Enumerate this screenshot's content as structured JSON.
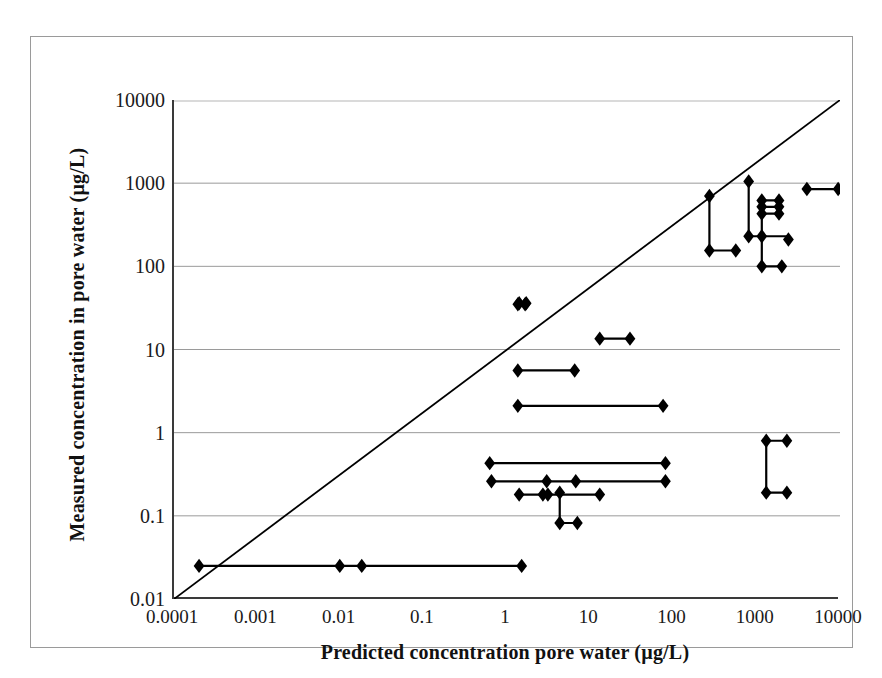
{
  "chart_data": {
    "type": "scatter",
    "title": "",
    "xlabel": "Predicted concentration pore water (µg/L)",
    "ylabel": "Measured concentration in  pore water (µg/L)",
    "xscale": "log",
    "yscale": "log",
    "xlim": [
      0.0001,
      10000
    ],
    "ylim": [
      0.01,
      10000
    ],
    "xticks": [
      "0.0001",
      "0.001",
      "0.01",
      "0.1",
      "1",
      "10",
      "100",
      "1000",
      "10000"
    ],
    "xtick_values": [
      0.0001,
      0.001,
      0.01,
      0.1,
      1,
      10,
      100,
      1000,
      10000
    ],
    "yticks": [
      "10000",
      "1000",
      "100",
      "10",
      "1",
      "0.1",
      "0.01"
    ],
    "ytick_values": [
      10000,
      1000,
      100,
      10,
      1,
      0.1,
      0.01
    ],
    "grid": "horizontal-major-only",
    "legend": "none",
    "marker": "filled-diamond",
    "marker_color": "#000000",
    "line_color": "#000000",
    "reference_line": {
      "name": "1:1 line",
      "from": [
        0.0001,
        0.01
      ],
      "to": [
        10000,
        10000
      ],
      "style": "solid",
      "color": "#000000"
    },
    "points": [
      {
        "x": 0.0002,
        "y": 0.025
      },
      {
        "x": 0.0098,
        "y": 0.025
      },
      {
        "x": 0.018,
        "y": 0.025
      },
      {
        "x": 1.5,
        "y": 0.025
      },
      {
        "x": 1.35,
        "y": 35
      },
      {
        "x": 1.65,
        "y": 35
      },
      {
        "x": 1.4,
        "y": 36
      },
      {
        "x": 1.7,
        "y": 36
      },
      {
        "x": 13,
        "y": 13.5
      },
      {
        "x": 30,
        "y": 13.5
      },
      {
        "x": 1.35,
        "y": 5.6
      },
      {
        "x": 6.5,
        "y": 5.6
      },
      {
        "x": 1.35,
        "y": 2.1
      },
      {
        "x": 75,
        "y": 2.1
      },
      {
        "x": 0.62,
        "y": 0.43
      },
      {
        "x": 80,
        "y": 0.43
      },
      {
        "x": 0.65,
        "y": 0.26
      },
      {
        "x": 3.0,
        "y": 0.26
      },
      {
        "x": 6.7,
        "y": 0.26
      },
      {
        "x": 80,
        "y": 0.26
      },
      {
        "x": 1.4,
        "y": 0.18
      },
      {
        "x": 2.7,
        "y": 0.18
      },
      {
        "x": 3.1,
        "y": 0.18
      },
      {
        "x": 13,
        "y": 0.18
      },
      {
        "x": 4.3,
        "y": 0.082
      },
      {
        "x": 7.0,
        "y": 0.082
      },
      {
        "x": 4.3,
        "y": 0.19
      },
      {
        "x": 270,
        "y": 700
      },
      {
        "x": 270,
        "y": 155
      },
      {
        "x": 560,
        "y": 155
      },
      {
        "x": 800,
        "y": 1050
      },
      {
        "x": 800,
        "y": 230
      },
      {
        "x": 1150,
        "y": 230
      },
      {
        "x": 1150,
        "y": 520
      },
      {
        "x": 1850,
        "y": 520
      },
      {
        "x": 1150,
        "y": 430
      },
      {
        "x": 1850,
        "y": 430
      },
      {
        "x": 1150,
        "y": 620
      },
      {
        "x": 1850,
        "y": 620
      },
      {
        "x": 2400,
        "y": 210
      },
      {
        "x": 1150,
        "y": 100
      },
      {
        "x": 2000,
        "y": 100
      },
      {
        "x": 4000,
        "y": 850
      },
      {
        "x": 9500,
        "y": 850
      },
      {
        "x": 1300,
        "y": 0.8
      },
      {
        "x": 2300,
        "y": 0.8
      },
      {
        "x": 1300,
        "y": 0.19
      },
      {
        "x": 2300,
        "y": 0.19
      }
    ],
    "ranges": [
      {
        "from": [
          0.0002,
          0.025
        ],
        "to": [
          1.5,
          0.025
        ]
      },
      {
        "from": [
          1.35,
          35
        ],
        "to": [
          1.65,
          35
        ]
      },
      {
        "from": [
          1.4,
          36
        ],
        "to": [
          1.7,
          36
        ]
      },
      {
        "from": [
          13,
          13.5
        ],
        "to": [
          30,
          13.5
        ]
      },
      {
        "from": [
          1.35,
          5.6
        ],
        "to": [
          6.5,
          5.6
        ]
      },
      {
        "from": [
          1.35,
          2.1
        ],
        "to": [
          75,
          2.1
        ]
      },
      {
        "from": [
          0.62,
          0.43
        ],
        "to": [
          80,
          0.43
        ]
      },
      {
        "from": [
          0.65,
          0.26
        ],
        "to": [
          80,
          0.26
        ]
      },
      {
        "from": [
          1.4,
          0.18
        ],
        "to": [
          13,
          0.18
        ]
      },
      {
        "from": [
          4.3,
          0.082
        ],
        "to": [
          7.0,
          0.082
        ]
      },
      {
        "from": [
          4.3,
          0.19
        ],
        "to": [
          4.3,
          0.082
        ]
      },
      {
        "from": [
          270,
          700
        ],
        "to": [
          270,
          155
        ]
      },
      {
        "from": [
          270,
          155
        ],
        "to": [
          560,
          155
        ]
      },
      {
        "from": [
          800,
          1050
        ],
        "to": [
          800,
          230
        ]
      },
      {
        "from": [
          800,
          230
        ],
        "to": [
          2400,
          230
        ]
      },
      {
        "from": [
          1150,
          620
        ],
        "to": [
          1850,
          620
        ]
      },
      {
        "from": [
          1150,
          520
        ],
        "to": [
          1850,
          520
        ]
      },
      {
        "from": [
          1150,
          430
        ],
        "to": [
          1850,
          430
        ]
      },
      {
        "from": [
          1150,
          620
        ],
        "to": [
          1150,
          100
        ]
      },
      {
        "from": [
          1150,
          100
        ],
        "to": [
          2000,
          100
        ]
      },
      {
        "from": [
          4000,
          850
        ],
        "to": [
          9500,
          850
        ]
      },
      {
        "from": [
          1300,
          0.8
        ],
        "to": [
          2300,
          0.8
        ]
      },
      {
        "from": [
          1300,
          0.19
        ],
        "to": [
          2300,
          0.19
        ]
      },
      {
        "from": [
          1300,
          0.8
        ],
        "to": [
          1300,
          0.19
        ]
      }
    ]
  }
}
